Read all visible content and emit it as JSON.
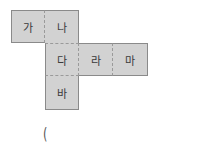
{
  "net": {
    "cells": [
      {
        "label": "가",
        "row": 0,
        "col": 0
      },
      {
        "label": "나",
        "row": 0,
        "col": 1
      },
      {
        "label": "다",
        "row": 1,
        "col": 1
      },
      {
        "label": "라",
        "row": 1,
        "col": 2
      },
      {
        "label": "마",
        "row": 1,
        "col": 3
      },
      {
        "label": "바",
        "row": 2,
        "col": 1
      }
    ],
    "fill_color": "#d2d2d2",
    "edge_color": "#8a8a8a"
  },
  "answer": {
    "open_paren": "("
  }
}
